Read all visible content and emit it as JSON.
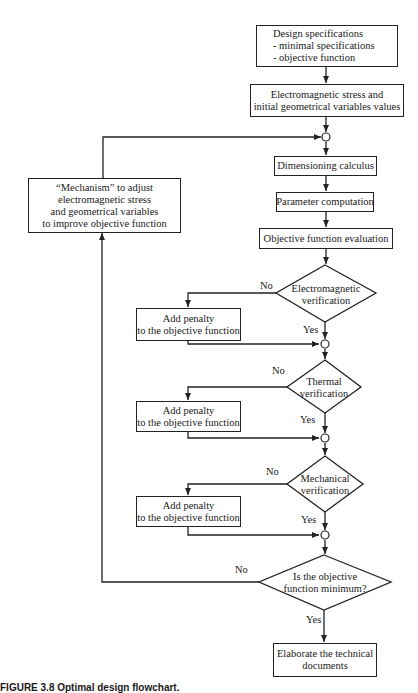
{
  "diagram": {
    "type": "flowchart",
    "nodes": {
      "design_specs": {
        "lines": [
          "Design specifications",
          "- minimal specifications",
          "- objective function"
        ]
      },
      "initial_values": {
        "lines": [
          "Electromagnetic stress and",
          "initial geometrical variables values"
        ]
      },
      "mechanism": {
        "lines": [
          "“Mechanism” to adjust",
          "electromagnetic stress",
          "and geometrical variables",
          "to improve objective function"
        ]
      },
      "dimensioning": {
        "lines": [
          "Dimensioning calculus"
        ]
      },
      "parameter": {
        "lines": [
          "Parameter computation"
        ]
      },
      "objective_eval": {
        "lines": [
          "Objective function evaluation"
        ]
      },
      "em_verification": {
        "lines": [
          "Electromagnetic",
          "verification"
        ]
      },
      "penalty_em": {
        "lines": [
          "Add penalty",
          "to the objective function"
        ]
      },
      "thermal_verification": {
        "lines": [
          "Thermal",
          "verification"
        ]
      },
      "penalty_thermal": {
        "lines": [
          "Add penalty",
          "to the objective function"
        ]
      },
      "mechanical_verification": {
        "lines": [
          "Mechanical",
          "verification"
        ]
      },
      "penalty_mechanical": {
        "lines": [
          "Add penalty",
          "to the objective function"
        ]
      },
      "minimum_check": {
        "lines": [
          "Is the objective",
          "function minimum?"
        ]
      },
      "elaborate_docs": {
        "lines": [
          "Elaborate the technical",
          "documents"
        ]
      }
    },
    "edge_labels": {
      "em_no": "No",
      "em_yes": "Yes",
      "thermal_no": "No",
      "thermal_yes": "Yes",
      "mechanical_no": "No",
      "mechanical_yes": "Yes",
      "minimum_no": "No",
      "minimum_yes": "Yes"
    },
    "caption": "FIGURE 3.8    Optimal design flowchart."
  }
}
